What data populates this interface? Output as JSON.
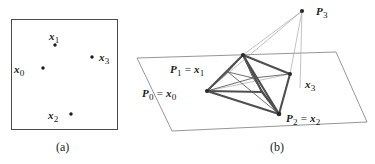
{
  "figure": {
    "background_color": "#ffffff",
    "ink_color": "#262626",
    "line_color": "#585858",
    "thin_line_color": "#9a9a9a",
    "panels": [
      {
        "id": "panel-a",
        "caption": "(a)",
        "caption_pos": [
          65,
          149
        ],
        "box": {
          "x": 11,
          "y": 19,
          "width": 107,
          "height": 111
        },
        "points": [
          {
            "name": "x0",
            "label": "x",
            "sub": "0",
            "dot": [
              43,
              68
            ],
            "label_pos": [
              23,
              70
            ],
            "label_anchor": "end"
          },
          {
            "name": "x1",
            "label": "x",
            "sub": "1",
            "dot": [
              55,
              45
            ],
            "label_pos": [
              55,
              36
            ],
            "label_anchor": "middle"
          },
          {
            "name": "x2",
            "label": "x",
            "sub": "2",
            "dot": [
              71,
              114
            ],
            "label_pos": [
              61,
              116
            ],
            "label_anchor": "end"
          },
          {
            "name": "x3",
            "label": "x",
            "sub": "3",
            "dot": [
              92,
              57
            ],
            "label_pos": [
              100,
              58
            ],
            "label_anchor": "start"
          }
        ]
      },
      {
        "id": "panel-b",
        "caption": "(b)",
        "caption_pos": [
          279,
          149
        ],
        "plane": {
          "corners": [
            [
              137,
              58
            ],
            [
              336,
              52
            ],
            [
              367,
              122
            ],
            [
              172,
              131
            ]
          ]
        },
        "vertices": [
          {
            "name": "P0",
            "label": "P_0 = x_0",
            "pos": [
              207,
              91
            ],
            "on_plane": true
          },
          {
            "name": "P1",
            "label": "P_1 = x_1",
            "pos": [
              243,
              55
            ],
            "on_plane": true
          },
          {
            "name": "P2",
            "label": "P_2 = x_2",
            "pos": [
              279,
              114
            ],
            "on_plane": true
          },
          {
            "name": "P3",
            "label": "P_3",
            "pos": [
              302,
              11
            ],
            "on_plane": false
          },
          {
            "name": "x3",
            "label": "x_3",
            "pos": [
              290,
              74
            ],
            "on_plane": true
          }
        ],
        "labels": [
          {
            "name": "label-P1-x1",
            "parts": [
              "P",
              "1",
              " = ",
              "x",
              "1"
            ],
            "pos": [
              176,
              71
            ],
            "anchor": "start"
          },
          {
            "name": "label-P0-x0",
            "parts": [
              "P",
              "0",
              " = ",
              "x",
              "0"
            ],
            "pos": [
              147,
              95
            ],
            "anchor": "start"
          },
          {
            "name": "label-P2-x2",
            "parts": [
              "P",
              "2",
              " = ",
              "x",
              "2"
            ],
            "pos": [
              286,
              120
            ],
            "anchor": "start"
          },
          {
            "name": "label-P3",
            "parts": [
              "P",
              "3"
            ],
            "pos": [
              316,
              14
            ],
            "anchor": "start"
          },
          {
            "name": "label-x3",
            "parts": [
              "x",
              "3"
            ],
            "pos": [
              305,
              87
            ],
            "anchor": "start"
          }
        ],
        "edges_thick": [
          [
            "P0",
            "P1"
          ],
          [
            "P0",
            "P2"
          ],
          [
            "P1",
            "P2"
          ],
          [
            "P1",
            "V_mid"
          ],
          [
            "P2",
            "V_mid"
          ],
          [
            "P0",
            "V_mid"
          ]
        ],
        "edges_thin": [
          [
            "P3",
            "P0"
          ],
          [
            "P3",
            "P1"
          ],
          [
            "P3",
            "P2"
          ],
          [
            "P3",
            "x3"
          ]
        ]
      }
    ]
  }
}
